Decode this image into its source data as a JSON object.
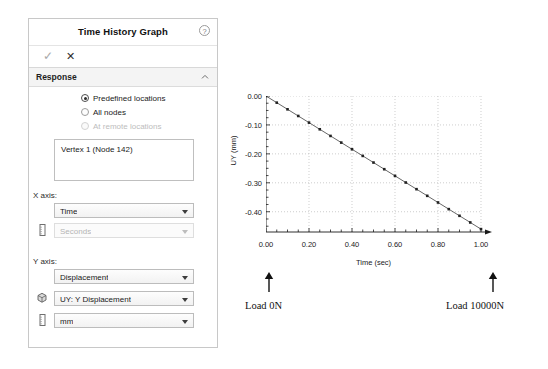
{
  "panel": {
    "title": "Time History Graph",
    "help_icon": "help-circle-icon",
    "actions": {
      "accept_label": "✓",
      "cancel_label": "✕"
    },
    "section": {
      "title": "Response",
      "collapse_icon": "chevron-up-icon"
    },
    "response_options": [
      {
        "label": "Predefined locations",
        "checked": true,
        "disabled": false
      },
      {
        "label": "All nodes",
        "checked": false,
        "disabled": false
      },
      {
        "label": "At remote locations",
        "checked": false,
        "disabled": true
      }
    ],
    "location_list": {
      "items": [
        "Vertex 1 (Node 142)"
      ]
    },
    "x_axis": {
      "label": "X axis:",
      "quantity": {
        "value": "Time",
        "disabled": false
      },
      "units": {
        "value": "Seconds",
        "disabled": true,
        "icon": "units-ruler-icon"
      }
    },
    "y_axis": {
      "label": "Y axis:",
      "quantity": {
        "value": "Displacement",
        "disabled": false
      },
      "component": {
        "value": "UY: Y Displacement",
        "disabled": false,
        "icon": "model-cube-icon"
      },
      "units": {
        "value": "mm",
        "disabled": false,
        "icon": "units-ruler-icon"
      }
    }
  },
  "annotations": {
    "left": {
      "text": "Load 0N",
      "icon": "arrow-up-icon"
    },
    "right": {
      "text": "Load 10000N",
      "icon": "arrow-up-icon"
    }
  },
  "chart_data": {
    "type": "line",
    "title": "",
    "xlabel": "Time (sec)",
    "ylabel": "UY (mm)",
    "xlim": [
      0.0,
      1.0
    ],
    "ylim": [
      -0.47,
      0.0
    ],
    "xticks": [
      "0.00",
      "0.20",
      "0.40",
      "0.60",
      "0.80",
      "1.00"
    ],
    "xtick_values": [
      0.0,
      0.2,
      0.4,
      0.6,
      0.8,
      1.0
    ],
    "yticks": [
      "0.00",
      "-0.10",
      "-0.20",
      "-0.30",
      "-0.40"
    ],
    "ytick_values": [
      0.0,
      -0.1,
      -0.2,
      -0.3,
      -0.4
    ],
    "xminor_step": 0.05,
    "yminor_step": 0.025,
    "grid": true,
    "grid_style": "dotted",
    "legend": "none",
    "marker": "square",
    "line_color": "#555555",
    "marker_color": "#222222",
    "x": [
      0.0,
      0.05,
      0.1,
      0.15,
      0.2,
      0.25,
      0.3,
      0.35,
      0.4,
      0.45,
      0.5,
      0.55,
      0.6,
      0.65,
      0.7,
      0.75,
      0.8,
      0.85,
      0.9,
      0.95,
      1.0
    ],
    "y": [
      0.0,
      -0.023,
      -0.046,
      -0.069,
      -0.092,
      -0.115,
      -0.138,
      -0.161,
      -0.184,
      -0.207,
      -0.23,
      -0.253,
      -0.276,
      -0.299,
      -0.322,
      -0.345,
      -0.368,
      -0.391,
      -0.414,
      -0.437,
      -0.46
    ]
  }
}
